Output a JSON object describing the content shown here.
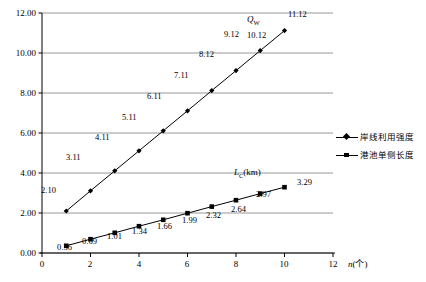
{
  "chart_data": {
    "type": "line",
    "title": "",
    "xlabel": "n(个)",
    "ylabel": "",
    "x": [
      1,
      2,
      3,
      4,
      5,
      6,
      7,
      8,
      9,
      10
    ],
    "xlim": [
      0,
      12
    ],
    "ylim": [
      0,
      12
    ],
    "x_ticks": [
      "0",
      "2",
      "4",
      "6",
      "8",
      "10",
      "12"
    ],
    "x_tick_values": [
      0,
      2,
      4,
      6,
      8,
      10,
      12
    ],
    "y_ticks": [
      "0.00",
      "2.00",
      "4.00",
      "6.00",
      "8.00",
      "10.00",
      "12.00"
    ],
    "y_tick_values": [
      0,
      2,
      4,
      6,
      8,
      10,
      12
    ],
    "grid": "horizontal",
    "legend_position": "right",
    "series": [
      {
        "name": "岸线利用强度",
        "inline_label": "Q",
        "inline_label_sub": "W",
        "marker": "diamond",
        "color": "#000000",
        "values": [
          2.1,
          3.11,
          4.11,
          5.11,
          6.11,
          7.11,
          8.12,
          9.12,
          10.12,
          11.12
        ],
        "point_labels": [
          "2.10",
          "3.11",
          "4.11",
          "5.11",
          "6.11",
          "7.11",
          "8.12",
          "9.12",
          "10.12",
          "11.12"
        ]
      },
      {
        "name": "港池单侧长度",
        "inline_label": "L",
        "inline_label_sub": "C",
        "inline_label_unit": "(km)",
        "marker": "square",
        "color": "#000000",
        "values": [
          0.36,
          0.69,
          1.01,
          1.34,
          1.66,
          1.99,
          2.32,
          2.64,
          2.97,
          3.29
        ],
        "point_labels": [
          "0.36",
          "0.69",
          "1.01",
          "1.34",
          "1.66",
          "1.99",
          "2.32",
          "2.64",
          "2.97",
          "3.29"
        ]
      }
    ]
  },
  "legend": {
    "items": [
      {
        "label": "岸线利用强度",
        "marker": "diamond"
      },
      {
        "label": "港池单侧长度",
        "marker": "square"
      }
    ]
  },
  "axes": {
    "x_axis_title": "n(个)",
    "x_axis_title_italic": "n",
    "x_axis_title_rest": "(个)"
  },
  "colors": {
    "line": "#000000",
    "grid": "#7f7f7f",
    "axis": "#000000",
    "background": "#ffffff"
  }
}
